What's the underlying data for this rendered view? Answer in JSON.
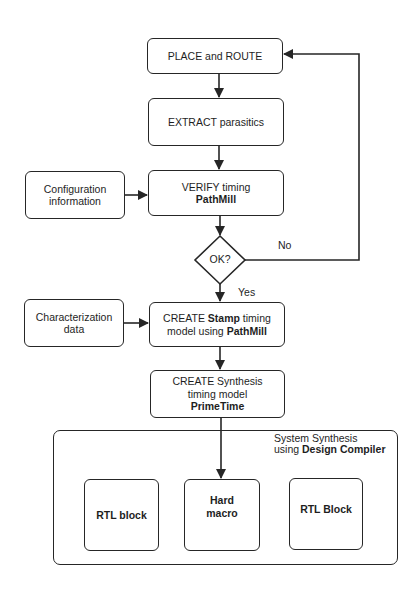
{
  "flowchart": {
    "nodes": {
      "place_route": {
        "label": "PLACE and ROUTE"
      },
      "extract": {
        "label": "EXTRACT parasitics"
      },
      "verify": {
        "line1": "VERIFY timing",
        "tool": "PathMill"
      },
      "config": {
        "line1": "Configuration",
        "line2": "information"
      },
      "decision": {
        "label": "OK?"
      },
      "characterization": {
        "line1": "Characterization",
        "line2": "data"
      },
      "stamp": {
        "pre": "CREATE ",
        "bold1": "Stamp",
        "post1": " timing",
        "pre2": "model using ",
        "bold2": "PathMill"
      },
      "synthesis": {
        "line1": "CREATE Synthesis",
        "line2": "timing model",
        "tool": "PrimeTime"
      },
      "system": {
        "line1": "System Synthesis",
        "pre2": "using ",
        "tool": "Design Compiler"
      },
      "rtl_block_1": {
        "label": "RTL block"
      },
      "hard_macro": {
        "line1": "Hard",
        "line2": "macro"
      },
      "rtl_block_2": {
        "label": "RTL Block"
      }
    },
    "edge_labels": {
      "no": "No",
      "yes": "Yes"
    },
    "colors": {
      "stroke": "#262626",
      "background": "#ffffff",
      "text": "#1e1e1e"
    }
  }
}
